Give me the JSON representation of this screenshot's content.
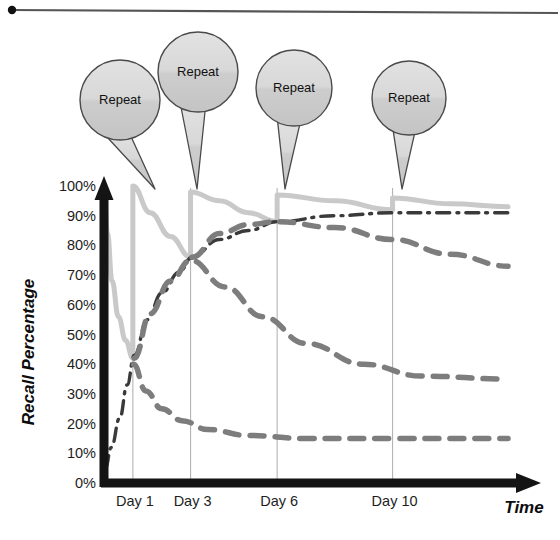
{
  "figure": {
    "top_rule": {
      "visible": true,
      "dot": true
    },
    "axes": {
      "x_axis_label": "Time",
      "y_axis_label": "Recall Percentage"
    }
  },
  "callouts": [
    {
      "label": "Repeat",
      "cx": 120,
      "cy": 100,
      "r": 40,
      "tail_x": 155
    },
    {
      "label": "Repeat",
      "cx": 198,
      "cy": 72,
      "r": 40,
      "tail_x": 197
    },
    {
      "label": "Repeat",
      "cx": 294,
      "cy": 88,
      "r": 38,
      "tail_x": 285
    },
    {
      "label": "Repeat",
      "cx": 409,
      "cy": 98,
      "r": 37,
      "tail_x": 402
    }
  ],
  "colors": {
    "axis": "#141414",
    "gridline": "#b4b4b4",
    "light_curve": "#c9c9c9",
    "dashed_curve": "#7d7d7d",
    "dashdot_curve": "#3a3a3a",
    "bubble_fill": "#d4d4d4",
    "bubble_stroke": "#4a4a4a",
    "text": "#1a1a1a",
    "background": "#ffffff"
  },
  "chart_data": {
    "type": "line",
    "title": "",
    "subtitle": "",
    "xlabel": "Time",
    "ylabel": "Recall Percentage",
    "xlim": [
      0,
      14
    ],
    "ylim": [
      0,
      100
    ],
    "grid": "vertical-only",
    "legend": "none",
    "ytick_labels": [
      "0%",
      "10%",
      "20%",
      "30%",
      "40%",
      "50%",
      "60%",
      "70%",
      "80%",
      "90%",
      "100%"
    ],
    "ytick_values": [
      0,
      10,
      20,
      30,
      40,
      50,
      60,
      70,
      80,
      90,
      100
    ],
    "xtick_labels": [
      "Day 1",
      "Day 3",
      "Day 6",
      "Day 10"
    ],
    "xtick_values": [
      1,
      3,
      6,
      10
    ],
    "annotations": [
      "Repeat",
      "Repeat",
      "Repeat",
      "Repeat"
    ],
    "repeat_events_days": [
      1,
      3,
      6,
      10
    ],
    "series": [
      {
        "name": "Recall with repetition (sawtooth)",
        "style": "solid",
        "color": "#c9c9c9",
        "width": 5,
        "points": [
          {
            "x": 0.0,
            "y": 100
          },
          {
            "x": 0.12,
            "y": 84
          },
          {
            "x": 0.28,
            "y": 68
          },
          {
            "x": 0.5,
            "y": 56
          },
          {
            "x": 0.75,
            "y": 48
          },
          {
            "x": 1.0,
            "y": 42
          },
          {
            "x": 1.0,
            "y": 100
          },
          {
            "x": 1.6,
            "y": 91
          },
          {
            "x": 2.3,
            "y": 83
          },
          {
            "x": 3.0,
            "y": 76
          },
          {
            "x": 3.0,
            "y": 98
          },
          {
            "x": 4.0,
            "y": 95
          },
          {
            "x": 5.0,
            "y": 91
          },
          {
            "x": 6.0,
            "y": 88
          },
          {
            "x": 6.0,
            "y": 97
          },
          {
            "x": 8.0,
            "y": 95
          },
          {
            "x": 10.0,
            "y": 92
          },
          {
            "x": 10.0,
            "y": 96
          },
          {
            "x": 12.0,
            "y": 94
          },
          {
            "x": 14.0,
            "y": 93
          }
        ]
      },
      {
        "name": "Cumulative long-term retention",
        "style": "dash-dot",
        "color": "#3a3a3a",
        "width": 3.4,
        "points": [
          {
            "x": 0.05,
            "y": 5
          },
          {
            "x": 0.25,
            "y": 12
          },
          {
            "x": 0.55,
            "y": 22
          },
          {
            "x": 0.8,
            "y": 33
          },
          {
            "x": 1.05,
            "y": 43
          },
          {
            "x": 1.5,
            "y": 55
          },
          {
            "x": 2.0,
            "y": 64
          },
          {
            "x": 2.6,
            "y": 71
          },
          {
            "x": 3.05,
            "y": 76
          },
          {
            "x": 4.0,
            "y": 82
          },
          {
            "x": 5.0,
            "y": 85
          },
          {
            "x": 6.0,
            "y": 88
          },
          {
            "x": 8.0,
            "y": 90
          },
          {
            "x": 10.0,
            "y": 91
          },
          {
            "x": 12.0,
            "y": 91
          },
          {
            "x": 14.0,
            "y": 91
          }
        ]
      },
      {
        "name": "Forgetting curve after 4th repetition",
        "style": "dashed",
        "color": "#7d7d7d",
        "width": 5.5,
        "points": [
          {
            "x": 3.05,
            "y": 76
          },
          {
            "x": 4.0,
            "y": 84
          },
          {
            "x": 5.0,
            "y": 87
          },
          {
            "x": 6.0,
            "y": 88
          },
          {
            "x": 8.0,
            "y": 86
          },
          {
            "x": 10.0,
            "y": 82
          },
          {
            "x": 12.0,
            "y": 77
          },
          {
            "x": 14.0,
            "y": 73
          }
        ]
      },
      {
        "name": "Forgetting curve after 2nd repetition",
        "style": "dashed",
        "color": "#7d7d7d",
        "width": 5.5,
        "points": [
          {
            "x": 1.05,
            "y": 42
          },
          {
            "x": 1.6,
            "y": 57
          },
          {
            "x": 2.3,
            "y": 68
          },
          {
            "x": 3.0,
            "y": 75
          },
          {
            "x": 4.2,
            "y": 66
          },
          {
            "x": 5.5,
            "y": 56
          },
          {
            "x": 7.0,
            "y": 47
          },
          {
            "x": 9.0,
            "y": 40
          },
          {
            "x": 11.0,
            "y": 36
          },
          {
            "x": 14.0,
            "y": 35
          }
        ]
      },
      {
        "name": "Forgetting curve after 1st learning",
        "style": "dashed",
        "color": "#7d7d7d",
        "width": 5.5,
        "points": [
          {
            "x": 1.02,
            "y": 40
          },
          {
            "x": 1.45,
            "y": 31
          },
          {
            "x": 2.0,
            "y": 25
          },
          {
            "x": 2.7,
            "y": 21
          },
          {
            "x": 3.6,
            "y": 18
          },
          {
            "x": 5.0,
            "y": 16
          },
          {
            "x": 7.0,
            "y": 15
          },
          {
            "x": 10.0,
            "y": 15
          },
          {
            "x": 14.0,
            "y": 15
          }
        ]
      }
    ]
  }
}
